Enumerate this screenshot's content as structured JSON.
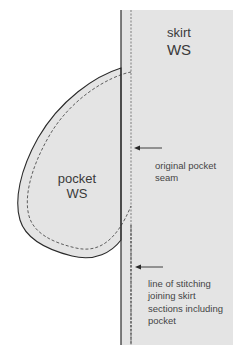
{
  "diagram": {
    "title": "",
    "colors": {
      "fabric_fill": "#e4e4e4",
      "outline": "#2a2a2a",
      "text": "#3a3a3a",
      "background": "#ffffff"
    },
    "skirt": {
      "label_line1": "skirt",
      "label_line2": "WS"
    },
    "pocket": {
      "label_line1": "pocket",
      "label_line2": "WS"
    },
    "annotations": [
      {
        "id": "original-pocket-seam",
        "lines": [
          "original pocket",
          "seam"
        ],
        "arrow": "left"
      },
      {
        "id": "skirt-joining-stitching",
        "lines": [
          "line of stitching",
          "joining skirt",
          "sections including",
          "pocket"
        ],
        "arrow": "left"
      }
    ]
  }
}
